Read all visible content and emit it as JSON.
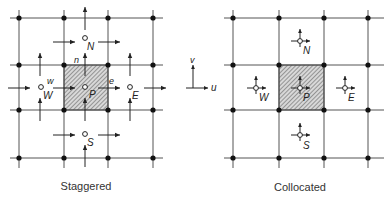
{
  "diagrams": [
    {
      "id": "staggered",
      "caption": "Staggered",
      "node_labels": {
        "P": "P",
        "W": "W",
        "E": "E",
        "N": "N",
        "S": "S"
      },
      "face_labels": {
        "n": "n",
        "w": "w",
        "e": "e"
      }
    },
    {
      "id": "collocated",
      "caption": "Collocated",
      "node_labels": {
        "P": "P",
        "W": "W",
        "E": "E",
        "N": "N",
        "S": "S"
      }
    }
  ],
  "axes": {
    "x_label": "u",
    "y_label": "v"
  },
  "colors": {
    "line": "#555555",
    "node": "#111111",
    "shade": "#b0b0b0",
    "arrow": "#222222"
  }
}
